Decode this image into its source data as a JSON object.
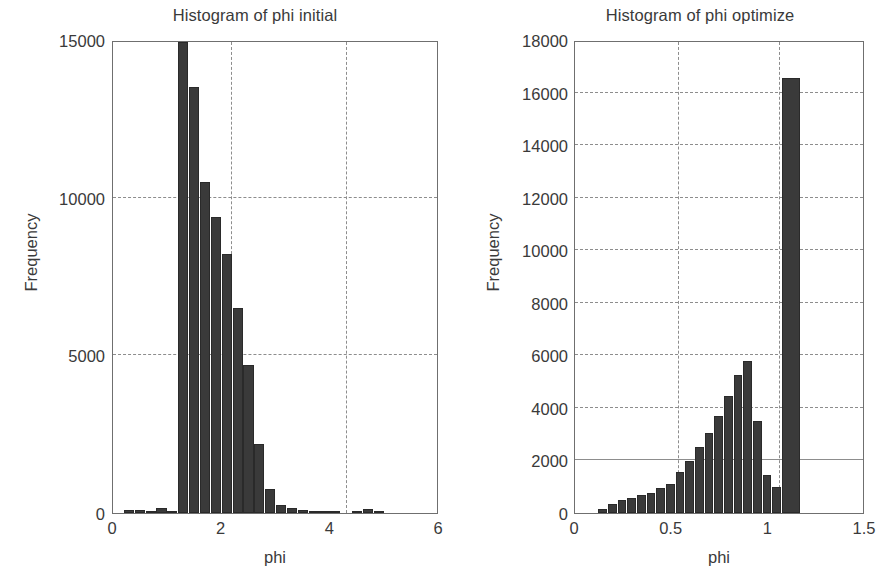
{
  "figure": {
    "background": "#ffffff",
    "ink_color": "#3a3a3a",
    "bar_color": "#3a3a3a",
    "grid_color": "#8d8d8d"
  },
  "chart_data": [
    {
      "type": "bar",
      "panel": "left",
      "title": "Histogram of phi initial",
      "xlabel": "phi",
      "ylabel": "Frequency",
      "xlim": [
        0,
        6
      ],
      "ylim": [
        0,
        15000
      ],
      "xticks": [
        "0",
        "2",
        "4",
        "6"
      ],
      "xtick_values": [
        0,
        2,
        4,
        6
      ],
      "yticks": [
        "0",
        "5000",
        "10000",
        "15000"
      ],
      "ytick_values": [
        0,
        5000,
        10000,
        15000
      ],
      "grid": true,
      "grid_h_values": [
        5000,
        10000
      ],
      "grid_v_values": [
        2.18,
        4.28
      ],
      "legend": "none",
      "bin_width": 0.2,
      "bins": [
        {
          "x0": 0.2,
          "x1": 0.4,
          "value": 90
        },
        {
          "x0": 0.4,
          "x1": 0.6,
          "value": 80
        },
        {
          "x0": 0.6,
          "x1": 0.8,
          "value": 20
        },
        {
          "x0": 0.8,
          "x1": 1.0,
          "value": 150
        },
        {
          "x0": 1.0,
          "x1": 1.2,
          "value": 40
        },
        {
          "x0": 1.2,
          "x1": 1.4,
          "value": 14950
        },
        {
          "x0": 1.4,
          "x1": 1.6,
          "value": 13500
        },
        {
          "x0": 1.6,
          "x1": 1.8,
          "value": 10500
        },
        {
          "x0": 1.8,
          "x1": 2.0,
          "value": 9400
        },
        {
          "x0": 2.0,
          "x1": 2.2,
          "value": 8200
        },
        {
          "x0": 2.2,
          "x1": 2.4,
          "value": 6500
        },
        {
          "x0": 2.4,
          "x1": 2.6,
          "value": 4700
        },
        {
          "x0": 2.6,
          "x1": 2.8,
          "value": 2200
        },
        {
          "x0": 2.8,
          "x1": 3.0,
          "value": 750
        },
        {
          "x0": 3.0,
          "x1": 3.2,
          "value": 250
        },
        {
          "x0": 3.2,
          "x1": 3.4,
          "value": 150
        },
        {
          "x0": 3.4,
          "x1": 3.6,
          "value": 90
        },
        {
          "x0": 3.6,
          "x1": 3.8,
          "value": 40
        },
        {
          "x0": 3.8,
          "x1": 4.0,
          "value": 30
        },
        {
          "x0": 4.0,
          "x1": 4.2,
          "value": 70
        },
        {
          "x0": 4.4,
          "x1": 4.6,
          "value": 30
        },
        {
          "x0": 4.6,
          "x1": 4.8,
          "value": 140
        },
        {
          "x0": 4.8,
          "x1": 5.0,
          "value": 20
        }
      ]
    },
    {
      "type": "bar",
      "panel": "right",
      "title": "Histogram of phi optimize",
      "xlabel": "phi",
      "ylabel": "Frequency",
      "xlim": [
        0,
        1.5
      ],
      "ylim": [
        0,
        18000
      ],
      "xticks": [
        "0",
        "0.5",
        "1",
        "1.5"
      ],
      "xtick_values": [
        0,
        0.5,
        1,
        1.5
      ],
      "yticks": [
        "0",
        "2000",
        "4000",
        "6000",
        "8000",
        "10000",
        "12000",
        "14000",
        "16000",
        "18000"
      ],
      "ytick_values": [
        0,
        2000,
        4000,
        6000,
        8000,
        10000,
        12000,
        14000,
        16000,
        18000
      ],
      "grid": true,
      "grid_h_values": [
        2000,
        4000,
        6000,
        8000,
        10000,
        12000,
        14000,
        16000
      ],
      "grid_h_solid_values": [
        2000
      ],
      "grid_v_values": [
        0.535,
        1.055
      ],
      "legend": "none",
      "bin_width": 0.05,
      "bins": [
        {
          "x0": 0.12,
          "x1": 0.17,
          "value": 150
        },
        {
          "x0": 0.17,
          "x1": 0.22,
          "value": 330
        },
        {
          "x0": 0.22,
          "x1": 0.27,
          "value": 500
        },
        {
          "x0": 0.27,
          "x1": 0.32,
          "value": 560
        },
        {
          "x0": 0.32,
          "x1": 0.37,
          "value": 700
        },
        {
          "x0": 0.37,
          "x1": 0.42,
          "value": 760
        },
        {
          "x0": 0.42,
          "x1": 0.47,
          "value": 950
        },
        {
          "x0": 0.47,
          "x1": 0.52,
          "value": 1120
        },
        {
          "x0": 0.52,
          "x1": 0.57,
          "value": 1550
        },
        {
          "x0": 0.57,
          "x1": 0.62,
          "value": 1980
        },
        {
          "x0": 0.62,
          "x1": 0.67,
          "value": 2500
        },
        {
          "x0": 0.67,
          "x1": 0.72,
          "value": 3050
        },
        {
          "x0": 0.72,
          "x1": 0.77,
          "value": 3700
        },
        {
          "x0": 0.77,
          "x1": 0.82,
          "value": 4450
        },
        {
          "x0": 0.82,
          "x1": 0.87,
          "value": 5250
        },
        {
          "x0": 0.87,
          "x1": 0.92,
          "value": 5800
        },
        {
          "x0": 0.92,
          "x1": 0.97,
          "value": 3500
        },
        {
          "x0": 0.97,
          "x1": 1.02,
          "value": 1450
        },
        {
          "x0": 1.02,
          "x1": 1.07,
          "value": 1000
        },
        {
          "x0": 1.07,
          "x1": 1.17,
          "value": 16550
        }
      ]
    }
  ]
}
